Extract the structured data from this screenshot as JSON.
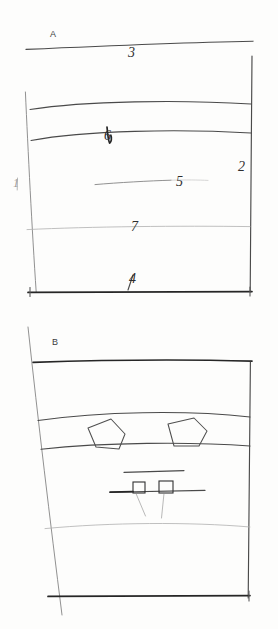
{
  "figure": {
    "medium": "pencil on paper",
    "background_color": "#fdfdfc",
    "ink_color": "#3a3a3a",
    "panel_count": 2
  },
  "panels": [
    {
      "id": "panel-a",
      "letter": "A",
      "letter_position": {
        "x": 50,
        "y": 37
      },
      "frame": {
        "top_line": {
          "from": [
            26,
            49
          ],
          "to": [
            253,
            41
          ],
          "weight": "medium"
        },
        "left_line": {
          "from": [
            25,
            92
          ],
          "to": [
            36,
            292
          ],
          "weight": "light"
        },
        "right_line": {
          "from": [
            252,
            56
          ],
          "to": [
            250,
            292
          ],
          "weight": "medium"
        },
        "bottom_line": {
          "from": [
            28,
            292
          ],
          "to": [
            252,
            292
          ],
          "weight": "dark"
        }
      },
      "horizons": [
        {
          "label": "3",
          "label_x": 128,
          "label_y": 57,
          "y_left": 49,
          "y_mid": 42,
          "y_right": 41,
          "weight": "medium",
          "note": "uppermost sloping horizon"
        },
        {
          "label": "",
          "label_x": null,
          "label_y": null,
          "y_left": 109,
          "y_mid": 101,
          "y_right": 104,
          "weight": "med",
          "note": "unlabelled arched horizon"
        },
        {
          "label": "6",
          "label_x": 110,
          "label_y": 136,
          "y_left": 140,
          "y_mid": 130,
          "y_right": 133,
          "weight": "med",
          "note": "arched horizon with marker at crest"
        },
        {
          "label": "5",
          "label_x": 180,
          "label_y": 184,
          "y_left": 183,
          "y_mid": 181,
          "y_right": 180,
          "weight": "light",
          "note": "short interior segment, x 95 to 170"
        },
        {
          "label": "7",
          "label_x": 136,
          "label_y": 228,
          "y_left": 229,
          "y_mid": 227,
          "y_right": 226,
          "weight": "faint",
          "note": "faint full-width horizon"
        },
        {
          "label": "4",
          "label_x": 134,
          "label_y": 281,
          "y_left": 292,
          "y_mid": 292,
          "y_right": 292,
          "weight": "dark",
          "note": "basal boundary"
        }
      ],
      "edge_labels": [
        {
          "label": "1",
          "x": 16,
          "y": 183,
          "side": "left",
          "note": "faint left-margin tick"
        },
        {
          "label": "2",
          "x": 240,
          "y": 167,
          "side": "right",
          "note": "right-margin tick"
        }
      ]
    },
    {
      "id": "panel-b",
      "letter": "B",
      "letter_position": {
        "x": 52,
        "y": 345
      },
      "frame": {
        "top_line": {
          "from": [
            33,
            362
          ],
          "to": [
            252,
            361
          ],
          "weight": "dark"
        },
        "left_line": {
          "from": [
            28,
            327
          ],
          "to": [
            62,
            615
          ],
          "weight": "light"
        },
        "right_line": {
          "from": [
            250,
            362
          ],
          "to": [
            248,
            598
          ],
          "weight": "medium"
        },
        "bottom_line": {
          "from": [
            48,
            596
          ],
          "to": [
            250,
            596
          ],
          "weight": "dark"
        }
      },
      "horizons": [
        {
          "label": "",
          "y_left": 420,
          "y_mid": 412,
          "y_right": 417,
          "weight": "med",
          "note": "top of deformed band"
        },
        {
          "label": "",
          "y_left": 449,
          "y_mid": 444,
          "y_right": 446,
          "weight": "med",
          "note": "base of deformed band"
        },
        {
          "label": "",
          "y_left": 528,
          "y_mid": 523,
          "y_right": 527,
          "weight": "faint",
          "note": "faint lower horizon"
        }
      ],
      "band_polygons": [
        {
          "name": "polygon-left",
          "points": "88,428 111,419 125,434 119,449 96,447"
        },
        {
          "name": "polygon-right",
          "points": "168,424 194,418 207,431 199,446 174,446"
        }
      ],
      "detail": {
        "name": "center-detail",
        "upper_rule": {
          "from": [
            124,
            472
          ],
          "to": [
            184,
            470
          ]
        },
        "base_rule": {
          "from": [
            110,
            492
          ],
          "to": [
            205,
            490
          ]
        },
        "boxes": [
          {
            "name": "detail-box-left",
            "x": 133,
            "y": 482,
            "w": 12,
            "h": 11
          },
          {
            "name": "detail-box-right",
            "x": 159,
            "y": 481,
            "w": 14,
            "h": 12
          }
        ],
        "leaders": [
          {
            "from": [
              136,
              493
            ],
            "to": [
              145,
              516
            ]
          },
          {
            "from": [
              164,
              493
            ],
            "to": [
              161,
              518
            ]
          }
        ]
      }
    }
  ]
}
